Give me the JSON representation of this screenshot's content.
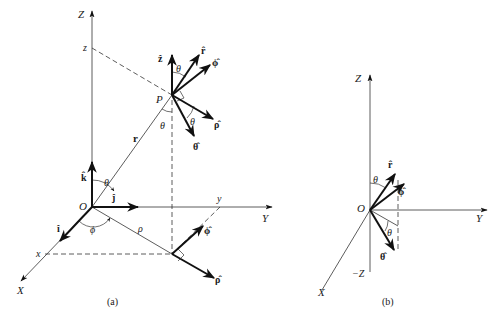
{
  "figure": {
    "panel_a": {
      "caption": "(a)",
      "axes": {
        "z": "Z",
        "y": "Y",
        "x": "X"
      },
      "origin": "O",
      "point": "P",
      "coord_marks": {
        "z": "z",
        "y": "y",
        "x": "x"
      },
      "position_vector": "r",
      "radial_distance": "ρ",
      "angles": {
        "theta": "θ",
        "phi": "ϕ"
      },
      "cartesian_unit_vectors": {
        "i": "î",
        "j": "ĵ",
        "k": "k̂"
      },
      "unit_vectors_at_P": {
        "z": "ẑ",
        "r": "r̂",
        "phi": "ϕ̂",
        "rho": "ρ̂",
        "theta": "θ̂"
      },
      "unit_vectors_at_projection": {
        "phi": "ϕ̂",
        "rho": "ρ̂"
      }
    },
    "panel_b": {
      "caption": "(b)",
      "axes": {
        "z": "Z",
        "neg_z": "−Z",
        "y": "Y",
        "x": "X"
      },
      "origin": "O",
      "angles": {
        "theta": "θ"
      },
      "unit_vectors": {
        "r": "r̂",
        "phi": "ϕ̂",
        "theta": "θ̂"
      }
    }
  }
}
